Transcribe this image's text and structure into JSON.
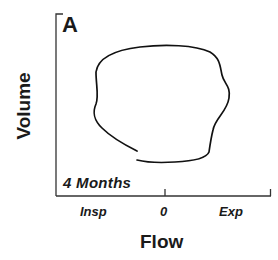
{
  "panel": {
    "label": "A",
    "age": "4 Months"
  },
  "axes": {
    "x_title": "Flow",
    "y_title": "Volume",
    "x_ticks": [
      "Insp",
      "0",
      "Exp"
    ]
  },
  "colors": {
    "ink": "#1a1a1a",
    "background": "#ffffff"
  },
  "curve": {
    "description": "Flow-volume loop (open, hand-drawn trace)",
    "shape": "irregular closed-ish loop with gap at lower left"
  }
}
